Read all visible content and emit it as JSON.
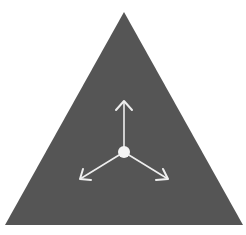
{
  "diagram": {
    "background": "#ffffff",
    "triangle": {
      "points": "124,12 5,225 243,225",
      "fill": "#555555"
    },
    "center": {
      "cx": 124,
      "cy": 152,
      "r": 6,
      "fill": "#f4f4f4"
    },
    "arrows": [
      {
        "name": "up",
        "x2": 124,
        "y2": 101,
        "head": "116,110 124,101 132,110"
      },
      {
        "name": "down-left",
        "x2": 80,
        "y2": 179,
        "head": "83,169 80,179 91,180"
      },
      {
        "name": "down-right",
        "x2": 168,
        "y2": 179,
        "head": "156,180 168,179 163,169"
      }
    ],
    "arrow_color": "#eeeeee"
  }
}
